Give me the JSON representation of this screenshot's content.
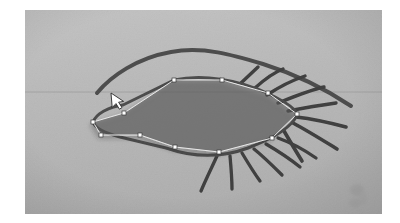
{
  "app": {
    "title": "image-annotation-canvas",
    "tool": "polygon-select"
  },
  "canvas": {
    "width": 400,
    "height": 223,
    "background_color": "#ffffff",
    "photo": {
      "name": "hand-drawn-eye-photo",
      "x": 25,
      "y": 10,
      "width": 357,
      "height": 204,
      "paper_color": "#b9b9b9",
      "ink_color": "#4a4a4a",
      "ruled_line": {
        "name": "ruled-paper-line",
        "y": 82,
        "color": "#9a9a9a",
        "x_start": 0,
        "x_end": 357
      },
      "drawing": {
        "brow_arc": {
          "name": "eyebrow-upper-lid-arc",
          "path": "M 72 83 C 86 66, 112 48, 146 42 C 178 36, 206 44, 236 52 C 268 61, 300 78, 326 95",
          "stroke": "#4d4d4d",
          "stroke_width": 4
        },
        "eye_outline": {
          "name": "eye-shape-outline",
          "path": "M 68 112 C 72 104, 84 97, 98 95 L 149 70 C 176 64, 212 68, 244 83 C 264 92, 272 100, 272 104 C 268 116, 250 128, 224 138 C 196 148, 166 147, 140 138 L 95 128 C 80 124, 70 118, 68 112 Z",
          "stroke": "#4d4d4d",
          "stroke_width": 3
        },
        "upper_lashes": [
          {
            "name": "upper-lash-1",
            "path": "M 214 74 L 230 58"
          },
          {
            "name": "upper-lash-2",
            "path": "M 228 79 C 238 70, 248 63, 256 60"
          },
          {
            "name": "upper-lash-3",
            "path": "M 241 85 C 252 78, 266 70, 278 66"
          },
          {
            "name": "upper-lash-4",
            "path": "M 252 92 C 266 87, 284 80, 298 77"
          },
          {
            "name": "upper-lash-5",
            "path": "M 263 100 C 278 98, 296 95, 310 93"
          }
        ],
        "outer_lashes": [
          {
            "name": "outer-lash-1",
            "path": "M 272 106 C 288 108, 306 112, 320 116"
          },
          {
            "name": "outer-lash-2",
            "path": "M 270 112 C 284 120, 300 130, 312 138"
          },
          {
            "name": "outer-lash-3",
            "path": "M 262 120 C 268 132, 274 142, 278 150"
          }
        ],
        "lower_lashes": [
          {
            "name": "lower-lash-1",
            "path": "M 195 146 C 190 156, 184 168, 178 180"
          },
          {
            "name": "lower-lash-2",
            "path": "M 207 145 C 208 156, 208 168, 208 178"
          },
          {
            "name": "lower-lash-3",
            "path": "M 218 142 C 224 152, 230 162, 236 170"
          },
          {
            "name": "lower-lash-4",
            "path": "M 230 138 C 240 146, 250 156, 258 164"
          },
          {
            "name": "lower-lash-5",
            "path": "M 242 133 C 254 140, 266 148, 276 156"
          },
          {
            "name": "lower-lash-6",
            "path": "M 254 127 C 268 132, 282 140, 292 147"
          }
        ],
        "smudge": {
          "name": "paper-smudge-mark",
          "x": 322,
          "y": 172,
          "width": 22,
          "height": 28,
          "color": "#a0a0a0"
        }
      }
    },
    "selection": {
      "name": "polygon-selection",
      "fill_color": "#5a5a5a",
      "fill_opacity": 0.55,
      "stroke_color": "#e8e8e8",
      "stroke_width": 1,
      "vertex_color": "#ffffff",
      "vertex_stroke": "#3a3a3a",
      "vertex_size": 3,
      "closed": true,
      "vertices": [
        {
          "name": "vertex-1",
          "x": 149,
          "y": 70
        },
        {
          "name": "vertex-2",
          "x": 197,
          "y": 70
        },
        {
          "name": "vertex-3",
          "x": 243,
          "y": 83
        },
        {
          "name": "vertex-4",
          "x": 272,
          "y": 104
        },
        {
          "name": "vertex-5",
          "x": 247,
          "y": 128
        },
        {
          "name": "vertex-6",
          "x": 194,
          "y": 142
        },
        {
          "name": "vertex-7",
          "x": 150,
          "y": 137
        },
        {
          "name": "vertex-8",
          "x": 115,
          "y": 125
        },
        {
          "name": "vertex-9",
          "x": 76,
          "y": 125
        },
        {
          "name": "vertex-10",
          "x": 68,
          "y": 112
        },
        {
          "name": "vertex-11",
          "x": 99,
          "y": 103
        }
      ]
    },
    "cursor": {
      "name": "mouse-cursor-arrow",
      "x": 113,
      "y": 96,
      "fill": "#ffffff",
      "stroke": "#2a2a2a"
    }
  }
}
